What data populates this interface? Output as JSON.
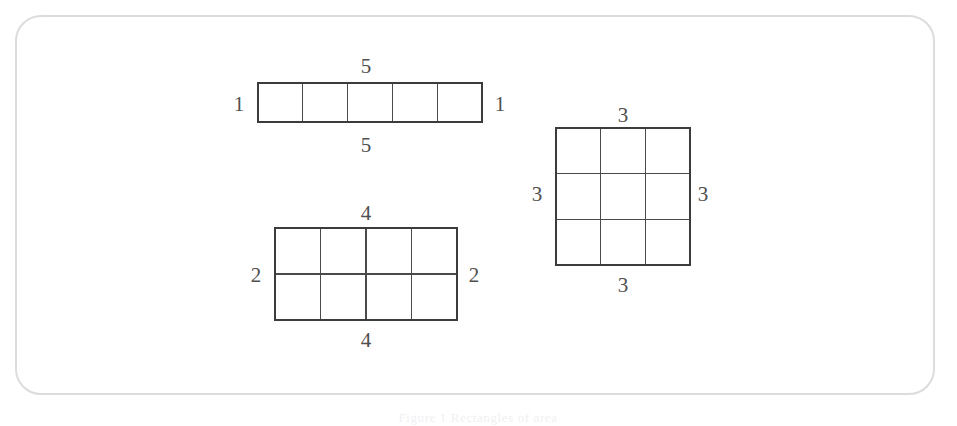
{
  "figure": {
    "background_color": "#ffffff",
    "panel_border_color": "#dcdcdc",
    "line_color": "#4a4a4a",
    "label_color": "#4f4f4f",
    "caption": "Figure 1  Rectangles of area"
  },
  "shapes": [
    {
      "id": "strip-1x5",
      "name": "one-by-five-strip",
      "columns": 5,
      "rows": 1,
      "x": 258,
      "y": 83,
      "width": 224,
      "height": 39,
      "labels": {
        "top": "5",
        "bottom": "5",
        "left": "1",
        "right": "1"
      },
      "label_positions": {
        "top": {
          "x": 366,
          "y": 66
        },
        "bottom": {
          "x": 366,
          "y": 145
        },
        "left": {
          "x": 239,
          "y": 104
        },
        "right": {
          "x": 500,
          "y": 104
        }
      }
    },
    {
      "id": "rect-4x2",
      "name": "four-by-two-rectangle",
      "columns": 4,
      "rows": 2,
      "x": 275,
      "y": 228,
      "width": 182,
      "height": 92,
      "labels": {
        "top": "4",
        "bottom": "4",
        "left": "2",
        "right": "2"
      },
      "label_positions": {
        "top": {
          "x": 366,
          "y": 213
        },
        "bottom": {
          "x": 366,
          "y": 340
        },
        "left": {
          "x": 256,
          "y": 275
        },
        "right": {
          "x": 474,
          "y": 275
        }
      }
    },
    {
      "id": "square-3x3",
      "name": "three-by-three-square",
      "columns": 3,
      "rows": 3,
      "x": 556,
      "y": 128,
      "width": 134,
      "height": 137,
      "labels": {
        "top": "3",
        "bottom": "3",
        "left": "3",
        "right": "3"
      },
      "label_positions": {
        "top": {
          "x": 623,
          "y": 115
        },
        "bottom": {
          "x": 623,
          "y": 285
        },
        "left": {
          "x": 537,
          "y": 194
        },
        "right": {
          "x": 703,
          "y": 194
        }
      }
    }
  ]
}
